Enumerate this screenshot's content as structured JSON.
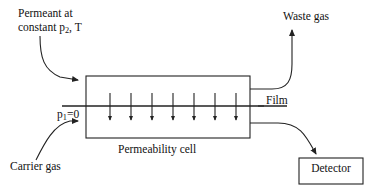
{
  "diagram": {
    "type": "schematic-flow-diagram",
    "background_color": "#ffffff",
    "line_color": "#222222",
    "labels": {
      "permeant_line1": "Permeant at",
      "permeant_line2_prefix": "constant p",
      "permeant_line2_sub": "2",
      "permeant_line2_suffix": ", T",
      "waste_gas": "Waste gas",
      "pressure_prefix": "p",
      "pressure_sub": "1",
      "pressure_suffix": "=0",
      "film": "Film",
      "carrier_gas": "Carrier gas",
      "permeability_cell": "Permeability cell",
      "detector": "Detector"
    },
    "components": {
      "cell_box": {
        "x": 86,
        "y": 76,
        "width": 164,
        "height": 62
      },
      "detector_box": {
        "x": 299,
        "y": 158,
        "width": 64,
        "height": 26
      },
      "film_line": {
        "x1": 62,
        "y1": 106,
        "x2": 287,
        "y2": 106
      },
      "permeation_arrow_count": 7,
      "permeation_arrow_x": [
        110,
        131,
        152,
        173,
        194,
        215,
        236
      ],
      "permeation_arrow_y_top": 93,
      "permeation_arrow_y_bottom": 122
    },
    "flows": [
      {
        "name": "permeant-inlet",
        "from": "Permeant at constant p2, T",
        "to": "cell top-left",
        "direction": "into-cell"
      },
      {
        "name": "carrier-inlet",
        "from": "Carrier gas",
        "to": "cell bottom-left",
        "direction": "into-cell"
      },
      {
        "name": "waste-outlet",
        "from": "cell top-right",
        "to": "Waste gas",
        "direction": "out-of-cell"
      },
      {
        "name": "detector-outlet",
        "from": "cell bottom-right",
        "to": "Detector",
        "direction": "out-of-cell"
      }
    ]
  }
}
